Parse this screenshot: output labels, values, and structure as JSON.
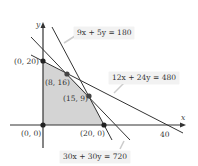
{
  "diagram": {
    "type": "linear-programming-feasible-region",
    "axes": {
      "x_label": "x",
      "y_label": "y",
      "x_tick_label": "40"
    },
    "constraints": [
      {
        "id": "c1",
        "label": "9x + 5y = 180"
      },
      {
        "id": "c2",
        "label": "12x + 24y = 480"
      },
      {
        "id": "c3",
        "label": "30x + 30y = 720"
      }
    ],
    "vertices": [
      {
        "label": "(0, 20)"
      },
      {
        "label": "(8, 16)"
      },
      {
        "label": "(15, 9)"
      },
      {
        "label": "(0, 0)"
      },
      {
        "label": "(20, 0)"
      }
    ],
    "colors": {
      "region": "#d4d4d4",
      "line": "#333333",
      "point": "#222222",
      "label_box": "#f2f2f2"
    }
  }
}
